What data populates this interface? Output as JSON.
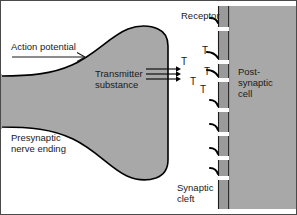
{
  "diagram": {
    "labels": {
      "action_potential": "Action potential",
      "presynaptic": "Presynaptic\nnerve ending",
      "transmitter": "Transmitter\nsubstance",
      "receptor": "Receptor",
      "postsynaptic": "Post-\nsynaptic\ncell",
      "synaptic_cleft": "Synaptic\ncleft"
    },
    "transmitter_molecules": [
      {
        "symbol": "T",
        "x": 181,
        "y": 57
      },
      {
        "symbol": "T",
        "x": 190,
        "y": 77
      },
      {
        "symbol": "T",
        "x": 202,
        "y": 46
      },
      {
        "symbol": "T",
        "x": 204,
        "y": 67
      },
      {
        "symbol": "T",
        "x": 200,
        "y": 85
      }
    ],
    "receptors": [
      {
        "name": "receptor-1",
        "y": 22
      },
      {
        "name": "receptor-2",
        "y": 56
      },
      {
        "name": "receptor-3",
        "y": 74
      },
      {
        "name": "receptor-4",
        "y": 104
      },
      {
        "name": "receptor-5",
        "y": 128
      },
      {
        "name": "receptor-6",
        "y": 152
      },
      {
        "name": "receptor-7",
        "y": 172
      }
    ],
    "release_arrows": [
      {
        "name": "release-arrow-1",
        "y": 69
      },
      {
        "name": "release-arrow-2",
        "y": 74
      },
      {
        "name": "release-arrow-3",
        "y": 79
      }
    ],
    "colors": {
      "cell_fill": "#a8a8a8",
      "membrane_fill": "#9a9a9a",
      "outline": "#000000",
      "background": "#ffffff",
      "text": "#1a1a1a",
      "frame": "#4a4a4a"
    }
  }
}
